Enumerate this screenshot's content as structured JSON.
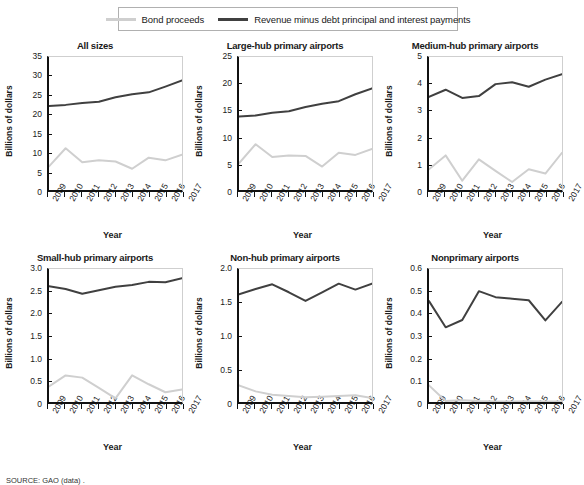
{
  "legend": {
    "entries": [
      {
        "label": "Bond proceeds",
        "color": "#cfcfcf",
        "key": "bond_proceeds"
      },
      {
        "label": "Revenue minus debt principal and interest payments",
        "color": "#404040",
        "key": "revenue_minus_debt"
      }
    ]
  },
  "source_note": "SOURCE: GAO (data) .",
  "axis_labels": {
    "x": "Year",
    "y": "Billions of dollars"
  },
  "years": [
    "2009",
    "2010",
    "2011",
    "2012",
    "2013",
    "2014",
    "2015",
    "2016",
    "2017"
  ],
  "chart_data": [
    {
      "type": "line",
      "title": "All sizes",
      "xlabel": "Year",
      "ylabel": "Billions of dollars",
      "x": [
        "2009",
        "2010",
        "2011",
        "2012",
        "2013",
        "2014",
        "2015",
        "2016",
        "2017"
      ],
      "ylim": [
        0,
        35
      ],
      "yticks": [
        "0",
        "5",
        "10",
        "15",
        "20",
        "25",
        "30",
        "35"
      ],
      "grid": false,
      "legend_position": "top",
      "series": [
        {
          "name": "Bond proceeds",
          "color": "#cfcfcf",
          "values": [
            6.2,
            11.0,
            7.3,
            7.8,
            7.5,
            5.6,
            8.5,
            7.8,
            9.3
          ]
        },
        {
          "name": "Revenue minus debt principal and interest payments",
          "color": "#404040",
          "values": [
            22.1,
            22.4,
            22.9,
            23.2,
            24.4,
            25.2,
            25.7,
            27.2,
            28.8
          ]
        }
      ]
    },
    {
      "type": "line",
      "title": "Large-hub primary airports",
      "xlabel": "Year",
      "ylabel": "Billions of dollars",
      "x": [
        "2009",
        "2010",
        "2011",
        "2012",
        "2013",
        "2014",
        "2015",
        "2016",
        "2017"
      ],
      "ylim": [
        0,
        25
      ],
      "yticks": [
        "0",
        "5",
        "10",
        "15",
        "20",
        "25"
      ],
      "grid": false,
      "legend_position": "top",
      "series": [
        {
          "name": "Bond proceeds",
          "color": "#cfcfcf",
          "values": [
            5.0,
            8.6,
            6.2,
            6.5,
            6.4,
            4.4,
            7.0,
            6.6,
            7.7
          ]
        },
        {
          "name": "Revenue minus debt principal and interest payments",
          "color": "#404040",
          "values": [
            13.8,
            14.0,
            14.5,
            14.8,
            15.6,
            16.2,
            16.7,
            18.0,
            19.1
          ]
        }
      ]
    },
    {
      "type": "line",
      "title": "Medium-hub primary airports",
      "xlabel": "Year",
      "ylabel": "Billions of dollars",
      "x": [
        "2009",
        "2010",
        "2011",
        "2012",
        "2013",
        "2014",
        "2015",
        "2016",
        "2017"
      ],
      "ylim": [
        0,
        5
      ],
      "yticks": [
        "0",
        "1",
        "2",
        "3",
        "4",
        "5"
      ],
      "grid": false,
      "legend_position": "top",
      "series": [
        {
          "name": "Bond proceeds",
          "color": "#cfcfcf",
          "values": [
            0.78,
            1.3,
            0.35,
            1.15,
            0.72,
            0.3,
            0.78,
            0.62,
            1.4
          ]
        },
        {
          "name": "Revenue minus debt principal and interest payments",
          "color": "#404040",
          "values": [
            3.5,
            3.77,
            3.46,
            3.53,
            3.98,
            4.05,
            3.88,
            4.15,
            4.35
          ]
        }
      ]
    },
    {
      "type": "line",
      "title": "Small-hub primary airports",
      "xlabel": "Year",
      "ylabel": "Billions of dollars",
      "x": [
        "2009",
        "2010",
        "2011",
        "2012",
        "2013",
        "2014",
        "2015",
        "2016",
        "2017"
      ],
      "ylim": [
        0,
        3.0
      ],
      "yticks": [
        "0",
        "0.5",
        "1.0",
        "1.5",
        "2.0",
        "2.5",
        "3.0"
      ],
      "grid": false,
      "legend_position": "top",
      "series": [
        {
          "name": "Bond proceeds",
          "color": "#cfcfcf",
          "values": [
            0.35,
            0.6,
            0.55,
            0.32,
            0.08,
            0.6,
            0.4,
            0.22,
            0.28
          ]
        },
        {
          "name": "Revenue minus debt principal and interest payments",
          "color": "#404040",
          "values": [
            2.61,
            2.55,
            2.44,
            2.52,
            2.6,
            2.64,
            2.71,
            2.7,
            2.79
          ]
        }
      ]
    },
    {
      "type": "line",
      "title": "Non-hub primary airports",
      "xlabel": "Year",
      "ylabel": "Billions of dollars",
      "x": [
        "2009",
        "2010",
        "2011",
        "2012",
        "2013",
        "2014",
        "2015",
        "2016",
        "2017"
      ],
      "ylim": [
        0,
        2.0
      ],
      "yticks": [
        "0",
        "0.5",
        "1.0",
        "1.5",
        "2.0"
      ],
      "grid": false,
      "legend_position": "top",
      "series": [
        {
          "name": "Bond proceeds",
          "color": "#cfcfcf",
          "values": [
            0.25,
            0.16,
            0.11,
            0.09,
            0.07,
            0.08,
            0.09,
            0.1,
            0.06
          ]
        },
        {
          "name": "Revenue minus debt principal and interest payments",
          "color": "#404040",
          "values": [
            1.62,
            1.7,
            1.77,
            1.65,
            1.52,
            1.65,
            1.78,
            1.69,
            1.78
          ]
        }
      ]
    },
    {
      "type": "line",
      "title": "Nonprimary airports",
      "xlabel": "Year",
      "ylabel": "Billions of dollars",
      "x": [
        "2009",
        "2010",
        "2011",
        "2012",
        "2013",
        "2014",
        "2015",
        "2016",
        "2017"
      ],
      "ylim": [
        0,
        0.6
      ],
      "yticks": [
        "0",
        "0.1",
        "0.2",
        "0.3",
        "0.4",
        "0.5",
        "0.6"
      ],
      "grid": false,
      "legend_position": "top",
      "series": [
        {
          "name": "Bond proceeds",
          "color": "#cfcfcf",
          "values": [
            0.075,
            0.005,
            0.008,
            0.004,
            0.002,
            0.002,
            0.003,
            0.002,
            0.002
          ]
        },
        {
          "name": "Revenue minus debt principal and interest payments",
          "color": "#404040",
          "values": [
            0.455,
            0.337,
            0.37,
            0.5,
            0.473,
            0.466,
            0.459,
            0.368,
            0.452
          ]
        }
      ]
    }
  ]
}
